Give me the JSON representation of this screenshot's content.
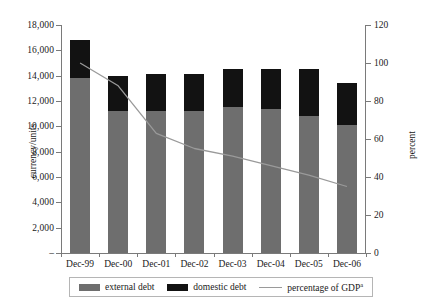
{
  "chart_data": {
    "type": "bar",
    "title": "",
    "subtitle": "",
    "categories": [
      "Dec-99",
      "Dec-00",
      "Dec-01",
      "Dec-02",
      "Dec-03",
      "Dec-04",
      "Dec-05",
      "Dec-06"
    ],
    "series": [
      {
        "name": "external debt",
        "type": "bar",
        "stack": "debt",
        "axis": "left",
        "color": "#6e6e6e",
        "values": [
          13800,
          11200,
          11200,
          11200,
          11500,
          11400,
          10800,
          10100
        ]
      },
      {
        "name": "domestic debt",
        "type": "bar",
        "stack": "debt",
        "axis": "left",
        "color": "#121212",
        "values": [
          3000,
          2800,
          2950,
          2900,
          3000,
          3100,
          3700,
          3300
        ]
      },
      {
        "name": "percentage of GDP",
        "type": "line",
        "axis": "right",
        "color": "#9a9a9a",
        "values": [
          100,
          88,
          63,
          55,
          51,
          46,
          41,
          35
        ]
      }
    ],
    "totals": [
      16800,
      14000,
      14150,
      14100,
      14500,
      14500,
      14500,
      13400
    ],
    "xlabel": "",
    "ylabel": "currency/units",
    "y2label": "percent",
    "ylim": [
      0,
      18000
    ],
    "y2lim": [
      0,
      120
    ],
    "yticks": [
      "–",
      "2,000",
      "4,000",
      "6,000",
      "8,000",
      "10,000",
      "12,000",
      "14,000",
      "16,000",
      "18,000"
    ],
    "ytick_values": [
      0,
      2000,
      4000,
      6000,
      8000,
      10000,
      12000,
      14000,
      16000,
      18000
    ],
    "y2ticks": [
      "0",
      "20",
      "40",
      "60",
      "80",
      "100",
      "120"
    ],
    "y2tick_values": [
      0,
      20,
      40,
      60,
      80,
      100,
      120
    ],
    "grid": false,
    "legend_position": "bottom",
    "legend": [
      {
        "label": "external debt",
        "marker": "swatch",
        "color": "#6e6e6e"
      },
      {
        "label": "domestic debt",
        "marker": "swatch",
        "color": "#121212"
      },
      {
        "label": "percentage of GDP",
        "marker": "line",
        "color": "#9a9a9a",
        "footnote": "a"
      }
    ],
    "annotations": []
  }
}
